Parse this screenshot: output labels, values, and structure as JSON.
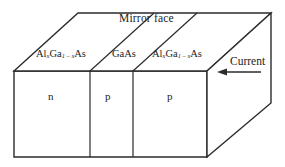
{
  "figure": {
    "title_label": "Mirror  face",
    "current_label": "Current",
    "stroke_color": "#2b2b2b",
    "fill_color": "#ffffff",
    "background_color": "#ffffff",
    "layers": [
      {
        "id": "layer-left",
        "material_prefix": "Al",
        "material_sub1": "x",
        "material_mid": "Ga",
        "material_sub2": "1 – x",
        "material_suffix": "As",
        "doping": "n"
      },
      {
        "id": "layer-middle",
        "material_prefix": "GaAs",
        "material_sub1": "",
        "material_mid": "",
        "material_sub2": "",
        "material_suffix": "",
        "doping": "p"
      },
      {
        "id": "layer-right",
        "material_prefix": "Al",
        "material_sub1": "x",
        "material_mid": "Ga",
        "material_sub2": "1 – x",
        "material_suffix": "As",
        "doping": "p"
      }
    ],
    "geometry": {
      "front_face": "14,71 207,71 207,157 14,157",
      "top_face": "14,71 78,13 271,13 207,71",
      "side_face": "207,71 271,13 271,103 207,157",
      "top_divider_1": "90,71 154,13",
      "top_divider_2": "133,71 197,13",
      "front_divider_1": "90,71 90,157",
      "front_divider_2": "133,71 133,157",
      "arrow_line": "261,72 221,72",
      "arrow_head": "218,72 226,69 226,75"
    }
  }
}
